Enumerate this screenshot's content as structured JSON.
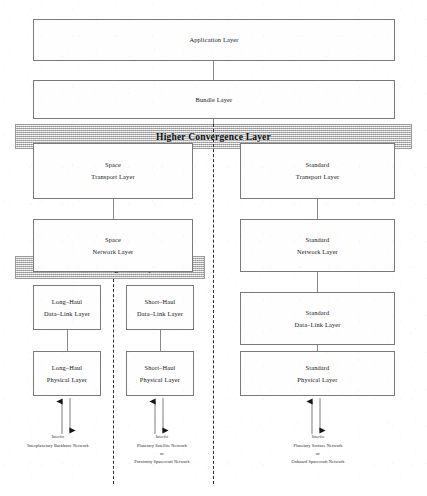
{
  "diagram": {
    "type": "layered-protocol-stack"
  },
  "boxes": {
    "application": {
      "line1": "Application Layer",
      "line2": ""
    },
    "bundle": {
      "line1": "Bundle Layer",
      "line2": ""
    },
    "space_transport": {
      "line1": "Space",
      "line2": "Transport Layer"
    },
    "standard_transport": {
      "line1": "Standard",
      "line2": "Transport Layer"
    },
    "space_network": {
      "line1": "Space",
      "line2": "Network Layer"
    },
    "standard_network": {
      "line1": "Standard",
      "line2": "Network Layer"
    },
    "longhaul_datalink": {
      "line1": "Long–Haul",
      "line2": "Data–Link Layer"
    },
    "shorthaul_datalink": {
      "line1": "Short–Haul",
      "line2": "Data–Link Layer"
    },
    "standard_datalink": {
      "line1": "Standard",
      "line2": "Data–Link Layer"
    },
    "longhaul_physical": {
      "line1": "Long–Haul",
      "line2": "Physical Layer"
    },
    "shorthaul_physical": {
      "line1": "Short–Haul",
      "line2": "Physical Layer"
    },
    "standard_physical": {
      "line1": "Standard",
      "line2": "Physical Layer"
    }
  },
  "bands": {
    "higher": {
      "label": "Higher Convergence Layer"
    },
    "lower": {
      "label": "Lower Convergence Layer"
    }
  },
  "networks": {
    "longhaul": {
      "header": "Interfic",
      "name1": "Interplanetary Backbone Network",
      "connector": "",
      "name2": ""
    },
    "shorthaul": {
      "header": "Interfic",
      "name1": "Planetary Satellite Network",
      "connector": "or",
      "name2": "Proximity Spacecraft Network"
    },
    "standard": {
      "header": "Interfic",
      "name1": "Planetary Surface Network",
      "connector": "or",
      "name2": "Onboard Spacecraft Network"
    }
  },
  "colors": {
    "box_border": "#7a7a7a",
    "band_fill": "#d8d8d8",
    "band_border": "#9a9a9a",
    "connector": "#8a8a8a",
    "dashed_separator": "#2b2b2b",
    "text": "#15161a",
    "page_background": "#ffffff"
  }
}
